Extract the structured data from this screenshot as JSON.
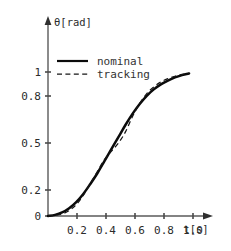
{
  "chart_data": {
    "type": "line",
    "title": "",
    "xlabel": "t[s]",
    "ylabel": "θ[rad]",
    "xlim": [
      0,
      1.12
    ],
    "ylim": [
      0,
      1.08
    ],
    "grid": false,
    "legend_position": "top-left-inside",
    "x_ticks": [
      0.2,
      0.4,
      0.6,
      0.8,
      1.0
    ],
    "x_tick_labels": [
      "0.2",
      "0.4",
      "0.6",
      "0.8",
      "1.0"
    ],
    "y_ticks": [
      0,
      0.2,
      0.5,
      0.8,
      1
    ],
    "y_tick_labels": [
      "0",
      "0.2",
      "0.5",
      "0.8",
      "1"
    ],
    "series": [
      {
        "name": "nominal",
        "style": "solid",
        "color": "#0b0b0b",
        "x": [
          0.0,
          0.05,
          0.1,
          0.15,
          0.2,
          0.25,
          0.3,
          0.35,
          0.4,
          0.45,
          0.5,
          0.55,
          0.6,
          0.65,
          0.7,
          0.75,
          0.8,
          0.85,
          0.9,
          0.95,
          1.0
        ],
        "y": [
          0.0,
          0.008,
          0.025,
          0.055,
          0.098,
          0.155,
          0.225,
          0.3,
          0.385,
          0.47,
          0.555,
          0.64,
          0.718,
          0.786,
          0.843,
          0.888,
          0.923,
          0.95,
          0.972,
          0.988,
          1.0
        ]
      },
      {
        "name": "tracking",
        "style": "dashed",
        "color": "#161616",
        "x": [
          0.0,
          0.05,
          0.1,
          0.15,
          0.2,
          0.25,
          0.3,
          0.35,
          0.4,
          0.45,
          0.5,
          0.55,
          0.6,
          0.65,
          0.7,
          0.75,
          0.8,
          0.85,
          0.9,
          0.95,
          1.0
        ],
        "y": [
          0.0,
          0.004,
          0.014,
          0.038,
          0.08,
          0.145,
          0.228,
          0.312,
          0.395,
          0.455,
          0.512,
          0.592,
          0.7,
          0.79,
          0.858,
          0.905,
          0.94,
          0.963,
          0.98,
          0.993,
          1.0
        ]
      }
    ],
    "legend_entries": [
      {
        "label": "nominal",
        "style": "solid"
      },
      {
        "label": "tracking",
        "style": "dashed"
      }
    ],
    "annotations": []
  },
  "axes": {
    "y_axis_label": "θ[rad]",
    "x_axis_label": "t[s]"
  },
  "colors": {
    "background": "#ffffff",
    "axis": "#5a5a5a",
    "nominal": "#0b0b0b",
    "tracking": "#161616",
    "text": "#2b2b2b"
  }
}
